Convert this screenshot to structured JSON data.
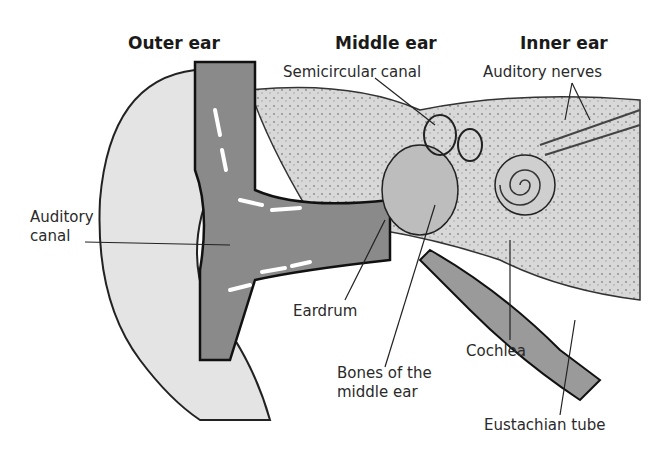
{
  "diagram": {
    "section_headers": [
      "Outer ear",
      "Middle ear",
      "Inner ear"
    ],
    "labels": {
      "semicircular_canal": "Semicircular canal",
      "auditory_nerves": "Auditory nerves",
      "auditory_canal_line1": "Auditory",
      "auditory_canal_line2": "canal",
      "eardrum": "Eardrum",
      "bones_line1": "Bones of the",
      "bones_line2": "middle ear",
      "cochlea": "Cochlea",
      "eustachian_tube": "Eustachian tube"
    }
  }
}
